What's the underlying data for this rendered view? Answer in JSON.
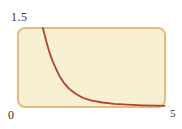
{
  "chart_data": {
    "type": "line",
    "title": "",
    "xlabel": "",
    "ylabel": "",
    "xlim": [
      0,
      5
    ],
    "ylim": [
      0,
      1.5
    ],
    "grid": false,
    "legend": "none",
    "axis_style": "rounded framed box, no tick marks, labels at extremes only",
    "x_tick_labels": {
      "origin": "0",
      "max": "5"
    },
    "y_tick_labels": {
      "max": "1.5"
    },
    "plot_box": {
      "fill": "#f7f0d3",
      "border_color": "#e3bd7f",
      "corner_radius_px": 8
    },
    "series": [
      {
        "name": "decay-curve",
        "color": "#b5402f",
        "stroke_width": 1.8,
        "points": [
          [
            0.84,
            1.5
          ],
          [
            0.9,
            1.37
          ],
          [
            0.97,
            1.22
          ],
          [
            1.05,
            1.06
          ],
          [
            1.15,
            0.9
          ],
          [
            1.27,
            0.74
          ],
          [
            1.4,
            0.59
          ],
          [
            1.55,
            0.46
          ],
          [
            1.72,
            0.35
          ],
          [
            1.95,
            0.25
          ],
          [
            2.2,
            0.17
          ],
          [
            2.5,
            0.12
          ],
          [
            2.85,
            0.085
          ],
          [
            3.25,
            0.06
          ],
          [
            3.7,
            0.045
          ],
          [
            4.2,
            0.033
          ],
          [
            4.7,
            0.024
          ],
          [
            4.95,
            0.02
          ]
        ]
      }
    ]
  },
  "labels": {
    "y_max": "1.5",
    "origin": "0",
    "x_max": "5",
    "text_color": "#3a3129"
  }
}
